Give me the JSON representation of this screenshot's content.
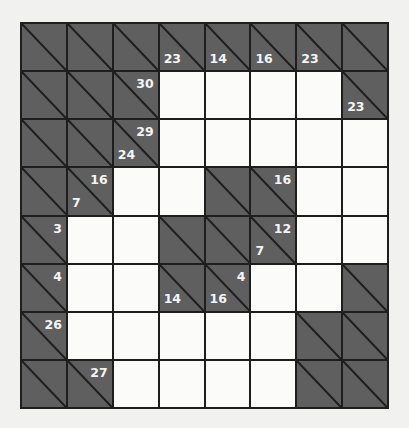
{
  "puzzle": {
    "type": "kakuro",
    "rows": 8,
    "cols": 8,
    "colors": {
      "block": "#5f5f5f",
      "entry": "#fbfbfa",
      "line": "#1e1e1e",
      "clue_text": "#f4f4f4",
      "background": "#f1f1ef"
    },
    "grid": [
      [
        {
          "t": "B"
        },
        {
          "t": "B"
        },
        {
          "t": "B"
        },
        {
          "t": "B",
          "down": "23"
        },
        {
          "t": "B",
          "down": "14"
        },
        {
          "t": "B",
          "down": "16"
        },
        {
          "t": "B",
          "down": "23"
        },
        {
          "t": "B"
        }
      ],
      [
        {
          "t": "B"
        },
        {
          "t": "B"
        },
        {
          "t": "B",
          "right": "30"
        },
        {
          "t": "W"
        },
        {
          "t": "W"
        },
        {
          "t": "W"
        },
        {
          "t": "W"
        },
        {
          "t": "B",
          "down": "23"
        }
      ],
      [
        {
          "t": "B"
        },
        {
          "t": "B"
        },
        {
          "t": "B",
          "right": "29",
          "down": "24"
        },
        {
          "t": "W"
        },
        {
          "t": "W"
        },
        {
          "t": "W"
        },
        {
          "t": "W"
        },
        {
          "t": "W"
        }
      ],
      [
        {
          "t": "B"
        },
        {
          "t": "B",
          "right": "16",
          "down": "7"
        },
        {
          "t": "W"
        },
        {
          "t": "W"
        },
        {
          "t": "B"
        },
        {
          "t": "B",
          "right": "16"
        },
        {
          "t": "W"
        },
        {
          "t": "W"
        }
      ],
      [
        {
          "t": "B",
          "right": "3"
        },
        {
          "t": "W"
        },
        {
          "t": "W"
        },
        {
          "t": "B"
        },
        {
          "t": "B"
        },
        {
          "t": "B",
          "right": "12",
          "down": "7"
        },
        {
          "t": "W"
        },
        {
          "t": "W"
        }
      ],
      [
        {
          "t": "B",
          "right": "4"
        },
        {
          "t": "W"
        },
        {
          "t": "W"
        },
        {
          "t": "B",
          "down": "14"
        },
        {
          "t": "B",
          "right": "4",
          "down": "16"
        },
        {
          "t": "W"
        },
        {
          "t": "W"
        },
        {
          "t": "B"
        }
      ],
      [
        {
          "t": "B",
          "right": "26"
        },
        {
          "t": "W"
        },
        {
          "t": "W"
        },
        {
          "t": "W"
        },
        {
          "t": "W"
        },
        {
          "t": "W"
        },
        {
          "t": "B"
        },
        {
          "t": "B"
        }
      ],
      [
        {
          "t": "B"
        },
        {
          "t": "B",
          "right": "27"
        },
        {
          "t": "W"
        },
        {
          "t": "W"
        },
        {
          "t": "W"
        },
        {
          "t": "W"
        },
        {
          "t": "B"
        },
        {
          "t": "B"
        }
      ]
    ]
  }
}
